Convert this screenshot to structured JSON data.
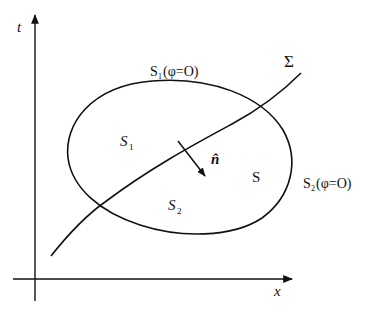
{
  "diagram": {
    "colors": {
      "stroke": "#111111",
      "background": "#ffffff"
    },
    "axes": {
      "vertical_label": "t",
      "horizontal_label": "x"
    },
    "curve_label": "Σ",
    "surface_label": "S",
    "normal_label": "n̂",
    "regions": {
      "s1": {
        "base": "S",
        "sub": "1"
      },
      "s2": {
        "base": "S",
        "sub": "2"
      }
    },
    "boundary_labels": {
      "s1": {
        "base": "S",
        "sub": "1",
        "rest": "(φ=O)"
      },
      "s2": {
        "base": "S",
        "sub": "2",
        "rest": "(φ=O)"
      }
    }
  }
}
